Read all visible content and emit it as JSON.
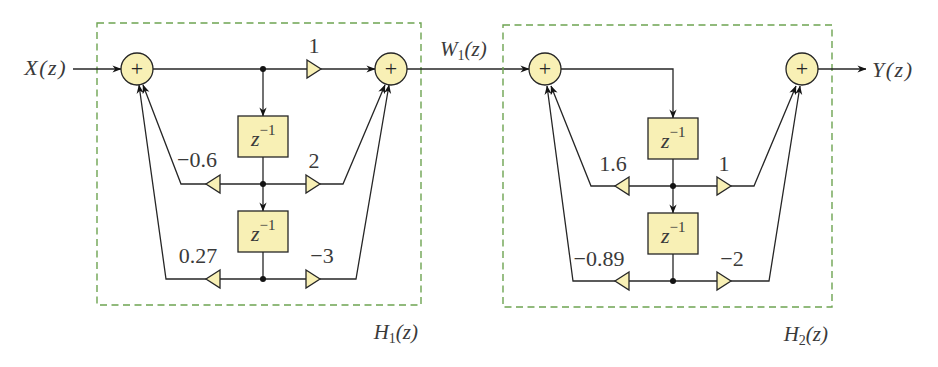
{
  "diagram": {
    "signals": {
      "input": {
        "base": "X",
        "arg": "(z)"
      },
      "intermediate": {
        "base": "W",
        "sub": "1",
        "arg": "(z)"
      },
      "output": {
        "base": "Y",
        "arg": "(z)"
      }
    },
    "summer_symbol": "+",
    "blocks": [
      {
        "id": "H1",
        "label": {
          "base": "H",
          "sub": "1",
          "arg": "(z)"
        },
        "direct_gain": "1",
        "delays": [
          {
            "base": "z",
            "exp": "−1"
          },
          {
            "base": "z",
            "exp": "−1"
          }
        ],
        "feedback_gains": [
          "−0.6",
          "0.27"
        ],
        "feedforward_gains": [
          "2",
          "−3"
        ]
      },
      {
        "id": "H2",
        "label": {
          "base": "H",
          "sub": "2",
          "arg": "(z)"
        },
        "delays": [
          {
            "base": "z",
            "exp": "−1"
          },
          {
            "base": "z",
            "exp": "−1"
          }
        ],
        "feedback_gains": [
          "1.6",
          "−0.89"
        ],
        "feedforward_gains": [
          "1",
          "−2"
        ]
      }
    ],
    "colors": {
      "node_fill": "#f8f0b5",
      "wire": "#262626",
      "frame": "#6ea452",
      "frame_label": "#7cae60",
      "intermediate_label": "#a0555a"
    }
  }
}
